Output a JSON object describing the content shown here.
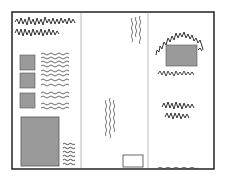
{
  "diagram": {
    "title": "",
    "colors": {
      "border": "#222222",
      "fill": "#9a9a9a",
      "text_scribble": "#333333",
      "divider": "#aaaaaa"
    },
    "panels": [
      {
        "name": "left-panel",
        "elements": [
          "heading-scribble",
          "image-square x3 with text lines",
          "large-image with caption lines"
        ]
      },
      {
        "name": "middle-panel",
        "elements": [
          "vertical text scribbles",
          "empty-box"
        ]
      },
      {
        "name": "right-panel",
        "elements": [
          "image with surrounding heading scribble",
          "text scribble block",
          "footer line"
        ]
      }
    ]
  }
}
